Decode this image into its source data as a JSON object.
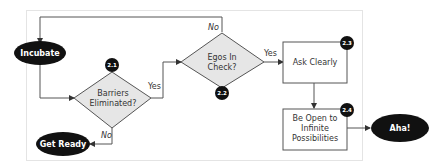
{
  "diagram": {
    "type": "flowchart",
    "colors": {
      "terminal_fill": "#111111",
      "terminal_text": "#ffffff",
      "decision_fill": "#e6e6e6",
      "process_fill": "#ffffff",
      "stroke": "#555555",
      "frame": "#e4e4e4",
      "badge_fill": "#111111"
    },
    "nodes": {
      "incubate": {
        "label": "Incubate",
        "shape": "oval"
      },
      "barriers": {
        "line1": "Barriers",
        "line2": "Eliminated?",
        "shape": "diamond",
        "badge": "2.1"
      },
      "egos": {
        "line1": "Egos In",
        "line2": "Check?",
        "shape": "diamond",
        "badge": "2.2"
      },
      "ask": {
        "label": "Ask Clearly",
        "shape": "rectangle",
        "badge": "2.3"
      },
      "open": {
        "line1": "Be Open to",
        "line2": "Infinite",
        "line3": "Possibilities",
        "shape": "rectangle",
        "badge": "2.4"
      },
      "get_ready": {
        "label": "Get Ready",
        "shape": "oval"
      },
      "aha": {
        "label": "Aha!",
        "shape": "oval"
      }
    },
    "edges": {
      "barriers_yes": "Yes",
      "barriers_no": "No",
      "egos_yes": "Yes",
      "egos_no": "No"
    }
  }
}
